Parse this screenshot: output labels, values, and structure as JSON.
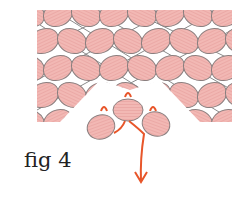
{
  "figure": {
    "caption": "fig 4",
    "bead_color": "#f2b8b4",
    "bead_stroke": "#8a7f7f",
    "thread_color": "#8a8a8a",
    "path_color": "#e8562a"
  }
}
